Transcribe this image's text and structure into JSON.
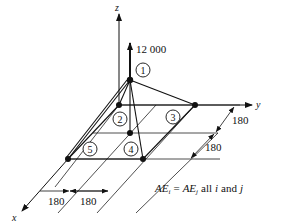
{
  "diagram": {
    "type": "space-truss",
    "axes": {
      "x": "x",
      "y": "y",
      "z": "z"
    },
    "load": {
      "value": "12 000",
      "direction": "up",
      "node": "1"
    },
    "nodes": [
      {
        "id": "1",
        "label": "1",
        "role": "apex"
      },
      {
        "id": "2",
        "label": "2",
        "role": "support"
      },
      {
        "id": "3",
        "label": "3",
        "role": "support"
      },
      {
        "id": "4",
        "label": "4",
        "role": "support"
      },
      {
        "id": "5",
        "label": "5",
        "role": "support"
      }
    ],
    "dimensions": {
      "x_spacing_1": "180",
      "x_spacing_2": "180",
      "y_spacing_1": "180",
      "y_spacing_2": "180"
    },
    "note": {
      "lhs": "AE",
      "lhs_sub": "i",
      "eq": "=",
      "rhs": "AE",
      "rhs_sub": "j",
      "tail_1": "all",
      "var_i": "i",
      "tail_2": "and",
      "var_j": "j"
    }
  }
}
